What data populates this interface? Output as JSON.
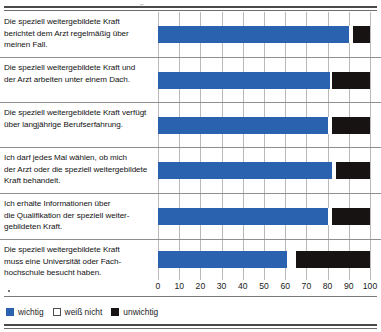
{
  "chart_data": {
    "type": "bar",
    "orientation": "horizontal",
    "stacked": true,
    "percent": true,
    "title": "",
    "xlabel": "",
    "ylabel": "",
    "xlim": [
      0,
      100
    ],
    "xticks": [
      0,
      10,
      20,
      30,
      40,
      50,
      60,
      70,
      80,
      90,
      100
    ],
    "xtick_labels": [
      "0",
      "10",
      "20",
      "30",
      "40",
      "50",
      "60",
      "70",
      "80",
      "90",
      "100"
    ],
    "grid": true,
    "legend_position": "bottom-left",
    "categories": [
      "Die speziell weitergebildete Kraft berichtet dem Arzt regelmäßig über meinen Fall.",
      "Die speziell weitergebildete Kraft und der Arzt arbeiten unter einem Dach.",
      "Die speziell weitergebildete Kraft verfügt über langjährige Berufserfahrung.",
      "Ich darf jedes Mal wählen, ob mich der Arzt oder die speziell weitergebildete Kraft behandelt.",
      "Ich erhalte Informationen über die Qualifikation der speziell weitergebildeten Kraft.",
      "Die speziell weitergebildete Kraft muss eine Universität oder Fachhochschule besucht haben."
    ],
    "series": [
      {
        "name": "wichtig",
        "color": "#2a62b0",
        "values": [
          90,
          81,
          80,
          82,
          80,
          61
        ]
      },
      {
        "name": "weiß nicht",
        "color": "#ffffff",
        "values": [
          2,
          1,
          2,
          2,
          2,
          4
        ]
      },
      {
        "name": "unwichtig",
        "color": "#171312",
        "values": [
          8,
          18,
          18,
          16,
          18,
          35
        ]
      }
    ]
  },
  "rows": [
    {
      "label_lines": [
        "Die speziell weitergebildete Kraft",
        "berichtet dem Arzt regelmäßig über",
        "meinen Fall."
      ],
      "wichtig": 90,
      "weiss_nicht": 2,
      "unwichtig": 8
    },
    {
      "label_lines": [
        "Die speziell weitergebildete Kraft und",
        "der Arzt arbeiten unter einem Dach."
      ],
      "wichtig": 81,
      "weiss_nicht": 1,
      "unwichtig": 18
    },
    {
      "label_lines": [
        "Die speziell weitergebildete Kraft verfügt",
        "über langjährige Berufserfahrung."
      ],
      "wichtig": 80,
      "weiss_nicht": 2,
      "unwichtig": 18
    },
    {
      "label_lines": [
        "Ich darf jedes Mal wählen, ob mich",
        "der Arzt oder die speziell weitergebildete",
        "Kraft behandelt."
      ],
      "wichtig": 82,
      "weiss_nicht": 2,
      "unwichtig": 16
    },
    {
      "label_lines": [
        "Ich erhalte Informationen über",
        "die Qualifikation der speziell weiter-",
        "gebildeten Kraft."
      ],
      "wichtig": 80,
      "weiss_nicht": 2,
      "unwichtig": 18
    },
    {
      "label_lines": [
        "Die speziell weitergebildete Kraft",
        "muss eine Universität oder Fach-",
        "hochschule besucht haben."
      ],
      "wichtig": 61,
      "weiss_nicht": 4,
      "unwichtig": 35
    }
  ],
  "axis": {
    "ticks": [
      "0",
      "10",
      "20",
      "30",
      "40",
      "50",
      "60",
      "70",
      "80",
      "90",
      "100"
    ]
  },
  "legend": {
    "items": [
      {
        "label": "wichtig",
        "color": "#2a62b0"
      },
      {
        "label": "weiß nicht",
        "color": "#ffffff"
      },
      {
        "label": "unwichtig",
        "color": "#171312"
      }
    ]
  }
}
